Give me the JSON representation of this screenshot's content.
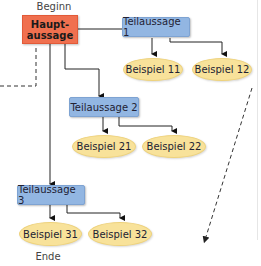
{
  "diagram": {
    "start_label": "Beginn",
    "end_label": "Ende",
    "main_node": {
      "line1": "Haupt-",
      "line2": "aussage",
      "color": "#f0704f"
    },
    "sub_nodes": [
      {
        "label": "Teilaussage 1",
        "color": "#92b6e2"
      },
      {
        "label": "Teilaussage 2",
        "color": "#92b6e2"
      },
      {
        "label": "Teilaussage 3",
        "color": "#92b6e2"
      }
    ],
    "example_nodes": [
      {
        "label": "Beispiel 11",
        "parent": "Teilaussage 1"
      },
      {
        "label": "Beispiel 12",
        "parent": "Teilaussage 1"
      },
      {
        "label": "Beispiel 21",
        "parent": "Teilaussage 2"
      },
      {
        "label": "Beispiel 22",
        "parent": "Teilaussage 2"
      },
      {
        "label": "Beispiel 31",
        "parent": "Teilaussage 3"
      },
      {
        "label": "Beispiel 32",
        "parent": "Teilaussage 3"
      }
    ],
    "example_color": "#f8e29a"
  }
}
